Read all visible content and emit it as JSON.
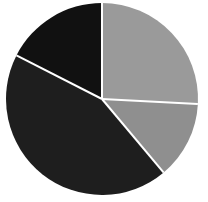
{
  "chart_data": {
    "type": "pie",
    "title": "",
    "subtitle": "",
    "xlabel": "",
    "ylabel": "",
    "grid": false,
    "legend": false,
    "legend_position": "none",
    "labels": [
      "Slice 1",
      "Slice 2",
      "Slice 3",
      "Slice 4"
    ],
    "values": [
      25.8,
      13.1,
      43.6,
      17.5
    ],
    "units": "percent",
    "start_angle_deg": 0,
    "direction": "clockwise",
    "colors": [
      "#9a9a9a",
      "#8f8f8f",
      "#1e1e1e",
      "#111111"
    ],
    "slice_separator_color": "#ffffff",
    "slice_separator_width": 2,
    "annotations": [],
    "slices": [
      {
        "label": "Slice 1",
        "value": 25.8,
        "color": "#9a9a9a",
        "start_angle_deg": 0,
        "end_angle_deg": 93,
        "position": "top-right"
      },
      {
        "label": "Slice 2",
        "value": 13.1,
        "color": "#8f8f8f",
        "start_angle_deg": 93,
        "end_angle_deg": 140,
        "position": "right-lower"
      },
      {
        "label": "Slice 3",
        "value": 43.6,
        "color": "#1e1e1e",
        "start_angle_deg": 140,
        "end_angle_deg": 297,
        "position": "bottom-left"
      },
      {
        "label": "Slice 4",
        "value": 17.5,
        "color": "#111111",
        "start_angle_deg": 297,
        "end_angle_deg": 360,
        "position": "top-left"
      }
    ],
    "geometry": {
      "center_x": 102,
      "center_y": 99,
      "radius": 96
    },
    "background_color": "#ffffff"
  }
}
